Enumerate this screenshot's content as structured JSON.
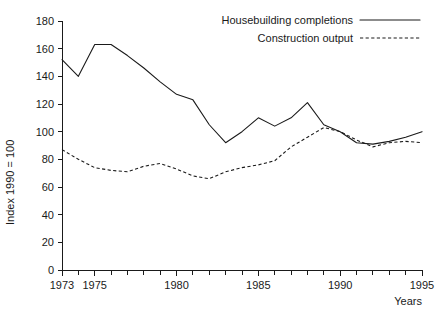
{
  "chart_data": {
    "type": "line",
    "title": "",
    "xlabel": "Years",
    "ylabel": "Index 1990 = 100",
    "xlim": [
      1973,
      1995
    ],
    "ylim": [
      0,
      180
    ],
    "grid": false,
    "legend_position": "top-right",
    "x": [
      1973,
      1974,
      1975,
      1976,
      1977,
      1978,
      1979,
      1980,
      1981,
      1982,
      1983,
      1984,
      1985,
      1986,
      1987,
      1988,
      1989,
      1990,
      1991,
      1992,
      1993,
      1994,
      1995
    ],
    "xticks": [
      1973,
      1974,
      1975,
      1976,
      1977,
      1978,
      1979,
      1980,
      1981,
      1982,
      1983,
      1984,
      1985,
      1986,
      1987,
      1988,
      1989,
      1990,
      1991,
      1992,
      1993,
      1994,
      1995
    ],
    "xtick_labels": [
      "1973",
      "",
      "1975",
      "",
      "",
      "",
      "",
      "1980",
      "",
      "",
      "",
      "",
      "1985",
      "",
      "",
      "",
      "",
      "1990",
      "",
      "",
      "",
      "",
      "1995"
    ],
    "yticks": [
      0,
      20,
      40,
      60,
      80,
      100,
      120,
      140,
      160,
      180
    ],
    "ytick_labels": [
      "0",
      "20",
      "40",
      "60",
      "80",
      "100",
      "120",
      "140",
      "160",
      "180"
    ],
    "series": [
      {
        "name": "Housebuilding completions",
        "style": "solid",
        "color": "#1a1a1a",
        "values": [
          152,
          140,
          163,
          163,
          155,
          146,
          136,
          127,
          123,
          105,
          92,
          100,
          110,
          104,
          110,
          121,
          105,
          100,
          92,
          91,
          93,
          96,
          100
        ]
      },
      {
        "name": "Construction output",
        "style": "dashed",
        "color": "#1a1a1a",
        "values": [
          87,
          80,
          74,
          72,
          71,
          75,
          77,
          73,
          68,
          66,
          71,
          74,
          76,
          79,
          89,
          96,
          103,
          100,
          94,
          89,
          92,
          93,
          92
        ]
      }
    ]
  },
  "legend": {
    "items": [
      {
        "label": "Housebuilding completions",
        "style": "solid"
      },
      {
        "label": "Construction output",
        "style": "dashed"
      }
    ]
  }
}
